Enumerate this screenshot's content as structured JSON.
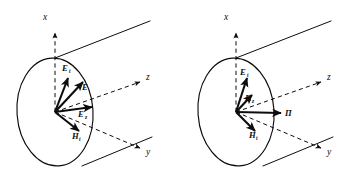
{
  "figure": {
    "kind": "technical-line-drawing",
    "background_color": "#ffffff",
    "ink_color": "#0d0d0d",
    "panel_count": 2
  },
  "panels": [
    {
      "id": "left-panel",
      "name": "field-vector-diagram-left",
      "axes": [
        {
          "name": "x-axis",
          "label": "x",
          "style": "dashed",
          "arrow": true
        },
        {
          "name": "z-axis",
          "label": "z",
          "style": "dashed",
          "arrow": true
        },
        {
          "name": "y-axis",
          "label": "y",
          "style": "dashed",
          "arrow": true
        }
      ],
      "vectors": [
        {
          "name": "E-t-vector",
          "label": "E",
          "sub": "t",
          "label_x": 62,
          "label_y": 71
        },
        {
          "name": "E-vector",
          "label": "E",
          "sub": "",
          "label_x": 82,
          "label_y": 90
        },
        {
          "name": "E-z-vector",
          "label": "E",
          "sub": "z",
          "label_x": 78,
          "label_y": 117
        },
        {
          "name": "H-t-vector",
          "label": "H",
          "sub": "t",
          "label_x": 72,
          "label_y": 139
        }
      ]
    },
    {
      "id": "right-panel",
      "name": "poynting-vector-diagram-right",
      "axes": [
        {
          "name": "x-axis",
          "label": "x",
          "style": "dashed",
          "arrow": true
        },
        {
          "name": "z-axis",
          "label": "z",
          "style": "dashed",
          "arrow": true
        },
        {
          "name": "y-axis",
          "label": "y",
          "style": "dashed",
          "arrow": true
        }
      ],
      "vectors": [
        {
          "name": "E-t-vector",
          "label": "E",
          "sub": "t",
          "label_x": 240,
          "label_y": 75
        },
        {
          "name": "Pi-z-vector",
          "label": "П",
          "sub": "z",
          "label_x": 245,
          "label_y": 101
        },
        {
          "name": "Pi-vector",
          "label": "П",
          "sub": "",
          "label_x": 285,
          "label_y": 116
        },
        {
          "name": "H-t-vector",
          "label": "H",
          "sub": "t",
          "label_x": 249,
          "label_y": 138
        }
      ]
    }
  ],
  "axis_labels": {
    "left": {
      "x": "x",
      "y": "y",
      "z": "z"
    },
    "right": {
      "x": "x",
      "y": "y",
      "z": "z"
    }
  }
}
